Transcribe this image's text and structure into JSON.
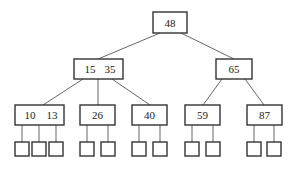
{
  "diagram": {
    "type": "b-tree",
    "root": {
      "keys": [
        "48"
      ]
    },
    "level1": [
      {
        "id": "n1535",
        "keys": [
          "15",
          "35"
        ]
      },
      {
        "id": "n65",
        "keys": [
          "65"
        ]
      }
    ],
    "level2": [
      {
        "id": "n1013",
        "keys": [
          "10",
          "13"
        ],
        "leaf_count": 3
      },
      {
        "id": "n26",
        "keys": [
          "26"
        ],
        "leaf_count": 2
      },
      {
        "id": "n40",
        "keys": [
          "40"
        ],
        "leaf_count": 2
      },
      {
        "id": "n59",
        "keys": [
          "59"
        ],
        "leaf_count": 2
      },
      {
        "id": "n87",
        "keys": [
          "87"
        ],
        "leaf_count": 2
      }
    ],
    "colors": {
      "stroke": "#333333",
      "background": "#ffffff"
    }
  }
}
